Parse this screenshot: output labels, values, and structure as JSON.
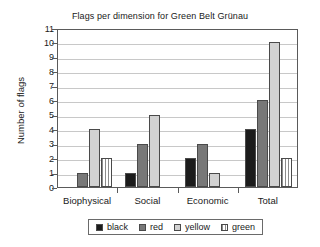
{
  "chart_data": {
    "type": "bar",
    "title": "Flags per dimension for Green Belt Grünau",
    "xlabel": "",
    "ylabel": "Number of flags",
    "categories": [
      "Biophysical",
      "Social",
      "Economic",
      "Total"
    ],
    "series": [
      {
        "name": "black",
        "color": "#1c1c1c",
        "values": [
          0,
          1,
          2,
          4
        ]
      },
      {
        "name": "red",
        "color": "#787878",
        "values": [
          1,
          3,
          3,
          6
        ]
      },
      {
        "name": "yellow",
        "color": "#d2d2d2",
        "values": [
          4,
          5,
          1,
          10
        ]
      },
      {
        "name": "green",
        "color": "#8c8c8c",
        "values": [
          2,
          0,
          0,
          2
        ]
      }
    ],
    "ylim": [
      0,
      11
    ],
    "yticks": [
      0,
      1,
      2,
      3,
      4,
      5,
      6,
      7,
      8,
      9,
      10,
      11
    ],
    "ytick_labels": [
      "0",
      "1",
      "2",
      "3",
      "4",
      "5",
      "6",
      "7",
      "8",
      "9",
      "10",
      "11"
    ],
    "grid": true,
    "legend_position": "bottom",
    "legend_entries": [
      "black",
      "red",
      "yellow",
      "green"
    ]
  }
}
